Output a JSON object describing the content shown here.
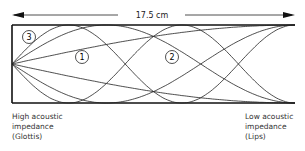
{
  "dimension": {
    "label": "17.5 cm"
  },
  "tube": {
    "x0": 12,
    "x1": 295,
    "top": 25,
    "bottom": 103
  },
  "modes": [
    {
      "label": "1",
      "harmonic": 1,
      "label_x": 82,
      "label_y": 57
    },
    {
      "label": "2",
      "harmonic": 3,
      "label_x": 172,
      "label_y": 57
    },
    {
      "label": "3",
      "harmonic": 5,
      "label_x": 29,
      "label_y": 37
    }
  ],
  "left_label": {
    "lines": [
      "High acoustic",
      "impedance",
      "(Glottis)"
    ]
  },
  "right_label": {
    "lines": [
      "Low acoustic",
      "impedance",
      "(Lips)"
    ]
  }
}
